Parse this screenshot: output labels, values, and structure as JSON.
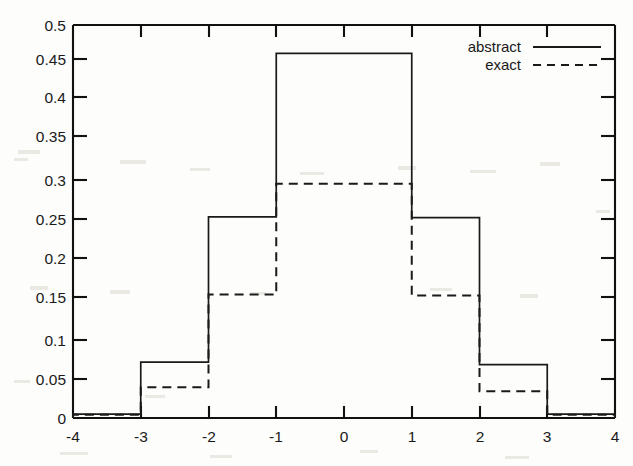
{
  "chart_data": {
    "type": "bar",
    "title": "",
    "subtitle": "",
    "xlabel": "",
    "ylabel": "",
    "xlim": [
      -4,
      4
    ],
    "ylim": [
      0,
      0.5
    ],
    "grid": false,
    "legend_position": "top-right",
    "x_ticks": [
      -4,
      -3,
      -2,
      -1,
      0,
      1,
      2,
      3,
      4
    ],
    "x_tick_labels": [
      "-4",
      "-3",
      "-2",
      "-1",
      "0",
      "1",
      "2",
      "3",
      "4"
    ],
    "y_ticks": [
      0,
      0.05,
      0.1,
      0.15,
      0.2,
      0.25,
      0.3,
      0.35,
      0.4,
      0.45,
      0.5
    ],
    "y_tick_labels": [
      "0",
      "0.05",
      "0.1",
      "0.15",
      "0.2",
      "0.25",
      "0.3",
      "0.35",
      "0.4",
      "0.45",
      "0.5"
    ],
    "bin_edges": [
      -4,
      -3,
      -2,
      -1,
      0,
      1,
      2,
      3,
      4
    ],
    "categories": [
      "-4 to -3",
      "-3 to -2",
      "-2 to -1",
      "-1 to 0",
      "0 to 1",
      "1 to 2",
      "2 to 3",
      "3 to 4"
    ],
    "series": [
      {
        "name": "abstract",
        "style": "solid",
        "color": "#1a1a1a",
        "values": [
          0.005,
          0.071,
          0.256,
          0.464,
          0.464,
          0.255,
          0.068,
          0.005
        ]
      },
      {
        "name": "exact",
        "style": "dashed",
        "color": "#1a1a1a",
        "values": [
          0.004,
          0.039,
          0.157,
          0.298,
          0.298,
          0.156,
          0.034,
          0.004
        ]
      }
    ]
  },
  "legend": {
    "entries": [
      {
        "label": "abstract",
        "style": "solid"
      },
      {
        "label": "exact",
        "style": "dashed"
      }
    ]
  }
}
